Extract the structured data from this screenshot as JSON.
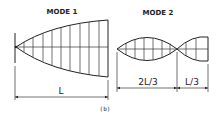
{
  "figure": {
    "caption": "(b)",
    "colors": {
      "stroke": "#222222",
      "background": "#ffffff"
    }
  },
  "mode1": {
    "title": "MODE 1",
    "dimension_label": "L"
  },
  "mode2": {
    "title": "MODE 2",
    "dimension_left_label": "2L/3",
    "dimension_right_label": "L/3"
  }
}
